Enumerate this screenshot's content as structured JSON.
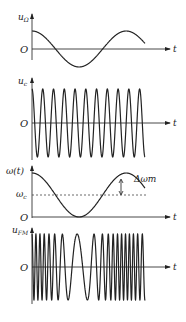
{
  "figure": {
    "panels": [
      {
        "id": "modulating",
        "y_label": "u",
        "y_label_sub": "Ω",
        "origin_label": "O",
        "x_label": "t",
        "description": "modulating signal (cosine, ~1 period)"
      },
      {
        "id": "carrier",
        "y_label": "u",
        "y_label_sub": "c",
        "origin_label": "O",
        "x_label": "t",
        "description": "carrier signal, ~11 cycles"
      },
      {
        "id": "instantaneous-frequency",
        "y_label": "ω(t)",
        "center_label": "ω",
        "center_label_sub": "c",
        "deviation_label": "Δωm",
        "origin_label": "O",
        "x_label": "t",
        "description": "instantaneous frequency follows modulating signal"
      },
      {
        "id": "fm-output",
        "y_label": "u",
        "y_label_sub": "FM",
        "origin_label": "O",
        "x_label": "t",
        "description": "FM wave: dense where ω high, sparse where ω low"
      }
    ]
  }
}
